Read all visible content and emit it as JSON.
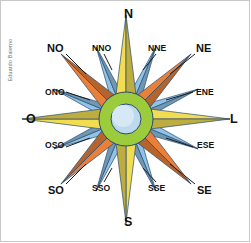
{
  "figure": {
    "credit": "Eduardo Baierno",
    "background_color": "#ffffff",
    "frame_color": "#c8c8c8"
  },
  "colors": {
    "cardinal_ray": "#f2dd52",
    "cardinal_ray_dark": "#d9b832",
    "intercardinal_ray": "#e8803a",
    "intercardinal_ray_dark": "#b8502a",
    "secondary_ray": "#8fc3e8",
    "secondary_ray_dark": "#4a7fae",
    "hub_outer": "#9ccb3b",
    "hub_inner": "#bcd9ee",
    "outline": "#2b4a6f",
    "label_text": "#111111"
  },
  "chart_data": {
    "type": "compass-rose",
    "center": [
      126,
      119
    ],
    "points": [
      {
        "label": "N",
        "abbr": "N",
        "angle_deg": 0,
        "order": "cardinal",
        "ray_color": "#f2dd52",
        "radius": 104,
        "label_x": 124,
        "label_y": 8,
        "label_class": "lab-card"
      },
      {
        "label": "NNE",
        "abbr": "NNE",
        "angle_deg": 22.5,
        "order": "secondary",
        "ray_color": "#8fc3e8",
        "radius": 78,
        "label_x": 148,
        "label_y": 44,
        "label_class": "lab-sec"
      },
      {
        "label": "NE",
        "abbr": "NE",
        "angle_deg": 45,
        "order": "intercardinal",
        "ray_color": "#e8803a",
        "radius": 92,
        "label_x": 196,
        "label_y": 43,
        "label_class": "lab-inter"
      },
      {
        "label": "ENE",
        "abbr": "ENE",
        "angle_deg": 67.5,
        "order": "secondary",
        "ray_color": "#8fc3e8",
        "radius": 78,
        "label_x": 196,
        "label_y": 88,
        "label_class": "lab-sec"
      },
      {
        "label": "L",
        "abbr": "L",
        "angle_deg": 90,
        "order": "cardinal",
        "ray_color": "#f2dd52",
        "radius": 104,
        "label_x": 230,
        "label_y": 113,
        "label_class": "lab-card"
      },
      {
        "label": "ESE",
        "abbr": "ESE",
        "angle_deg": 112.5,
        "order": "secondary",
        "ray_color": "#8fc3e8",
        "radius": 78,
        "label_x": 197,
        "label_y": 141,
        "label_class": "lab-sec"
      },
      {
        "label": "SE",
        "abbr": "SE",
        "angle_deg": 135,
        "order": "intercardinal",
        "ray_color": "#e8803a",
        "radius": 92,
        "label_x": 197,
        "label_y": 185,
        "label_class": "lab-inter"
      },
      {
        "label": "SSE",
        "abbr": "SSE",
        "angle_deg": 157.5,
        "order": "secondary",
        "ray_color": "#8fc3e8",
        "radius": 78,
        "label_x": 148,
        "label_y": 184,
        "label_class": "lab-sec"
      },
      {
        "label": "S",
        "abbr": "S",
        "angle_deg": 180,
        "order": "cardinal",
        "ray_color": "#f2dd52",
        "radius": 104,
        "label_x": 124,
        "label_y": 216,
        "label_class": "lab-card"
      },
      {
        "label": "SSO",
        "abbr": "SSO",
        "angle_deg": 202.5,
        "order": "secondary",
        "ray_color": "#8fc3e8",
        "radius": 78,
        "label_x": 92,
        "label_y": 184,
        "label_class": "lab-sec"
      },
      {
        "label": "SO",
        "abbr": "SO",
        "angle_deg": 225,
        "order": "intercardinal",
        "ray_color": "#e8803a",
        "radius": 92,
        "label_x": 48,
        "label_y": 185,
        "label_class": "lab-inter"
      },
      {
        "label": "OSO",
        "abbr": "OSO",
        "angle_deg": 247.5,
        "order": "secondary",
        "ray_color": "#8fc3e8",
        "radius": 78,
        "label_x": 45,
        "label_y": 141,
        "label_class": "lab-sec"
      },
      {
        "label": "O",
        "abbr": "O",
        "angle_deg": 270,
        "order": "cardinal",
        "ray_color": "#f2dd52",
        "radius": 104,
        "label_x": 26,
        "label_y": 113,
        "label_class": "lab-card"
      },
      {
        "label": "ONO",
        "abbr": "ONO",
        "angle_deg": 292.5,
        "order": "secondary",
        "ray_color": "#8fc3e8",
        "radius": 78,
        "label_x": 45,
        "label_y": 88,
        "label_class": "lab-sec"
      },
      {
        "label": "NO",
        "abbr": "NO",
        "angle_deg": 315,
        "order": "intercardinal",
        "ray_color": "#e8803a",
        "radius": 92,
        "label_x": 47,
        "label_y": 43,
        "label_class": "lab-inter"
      },
      {
        "label": "NNO",
        "abbr": "NNO",
        "angle_deg": 337.5,
        "order": "secondary",
        "ray_color": "#8fc3e8",
        "radius": 78,
        "label_x": 92,
        "label_y": 44,
        "label_class": "lab-sec"
      }
    ],
    "hub": {
      "outer_radius": 27,
      "inner_radius": 15,
      "cx": 126,
      "cy": 119
    },
    "leader_lines": [
      {
        "for": "NNE",
        "x1": 156,
        "y1": 54,
        "x2": 143,
        "y2": 70
      },
      {
        "for": "NE",
        "x1": 195,
        "y1": 54,
        "x2": 170,
        "y2": 74
      },
      {
        "for": "ENE",
        "x1": 193,
        "y1": 92,
        "x2": 166,
        "y2": 100
      },
      {
        "for": "ESE",
        "x1": 193,
        "y1": 147,
        "x2": 166,
        "y2": 138
      },
      {
        "for": "SE",
        "x1": 195,
        "y1": 184,
        "x2": 170,
        "y2": 164
      },
      {
        "for": "SSE",
        "x1": 156,
        "y1": 182,
        "x2": 143,
        "y2": 168
      },
      {
        "for": "SSO",
        "x1": 104,
        "y1": 182,
        "x2": 112,
        "y2": 168
      },
      {
        "for": "SO",
        "x1": 66,
        "y1": 184,
        "x2": 86,
        "y2": 164
      },
      {
        "for": "OSO",
        "x1": 66,
        "y1": 147,
        "x2": 90,
        "y2": 138
      },
      {
        "for": "ONO",
        "x1": 66,
        "y1": 92,
        "x2": 90,
        "y2": 100
      },
      {
        "for": "NO",
        "x1": 66,
        "y1": 54,
        "x2": 86,
        "y2": 74
      },
      {
        "for": "NNO",
        "x1": 104,
        "y1": 54,
        "x2": 112,
        "y2": 70
      }
    ]
  }
}
